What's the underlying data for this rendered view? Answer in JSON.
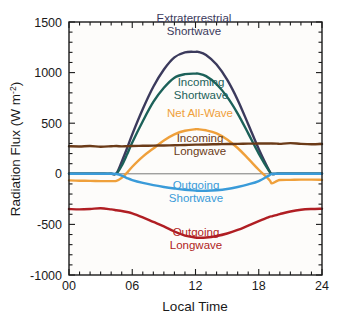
{
  "chart_data": {
    "type": "line",
    "title": "",
    "xlabel": "Local Time",
    "ylabel": "Radiation Flux (W m-2)",
    "ylabel_main": "Radiation Flux (W m",
    "ylabel_sup": "-2",
    "ylabel_close": ")",
    "xlim": [
      0,
      24
    ],
    "ylim": [
      -1000,
      1500
    ],
    "grid": false,
    "legend_position": "inline-annotations",
    "xticks": [
      0,
      6,
      12,
      18,
      24
    ],
    "xticklabels": [
      "00",
      "06",
      "12",
      "18",
      "24"
    ],
    "xminortick_interval": 1,
    "yticks": [
      -1000,
      -500,
      0,
      500,
      1000,
      1500
    ],
    "yticklabels": [
      "-1000",
      "-500",
      "0",
      "500",
      "1000",
      "1500"
    ],
    "yminortick_interval": 100,
    "zero_line": true,
    "x": [
      0,
      1,
      2,
      3,
      4,
      4.5,
      5,
      5.5,
      6,
      7,
      8,
      9,
      10,
      11,
      12,
      12.25,
      13,
      14,
      15,
      16,
      17,
      18,
      19,
      19.25,
      19.75,
      20,
      21,
      22,
      23,
      24
    ],
    "series": [
      {
        "name": "Extraterrestrial Shortwave",
        "color": "#3b3a5c",
        "label_color": "#3b3a5c",
        "values": [
          0,
          0,
          0,
          0,
          0,
          5,
          120,
          250,
          390,
          640,
          860,
          1030,
          1150,
          1200,
          1205,
          1205,
          1175,
          1080,
          930,
          730,
          490,
          245,
          30,
          0,
          0,
          0,
          0,
          0,
          0,
          0
        ]
      },
      {
        "name": "Incoming Shortwave",
        "color": "#1c6159",
        "label_color": "#1c6159",
        "values": [
          0,
          0,
          0,
          0,
          0,
          2,
          80,
          190,
          310,
          520,
          710,
          850,
          950,
          985,
          990,
          990,
          965,
          885,
          760,
          595,
          400,
          200,
          25,
          0,
          0,
          0,
          0,
          0,
          0,
          0
        ]
      },
      {
        "name": "Net All-Wave",
        "color": "#efa03b",
        "label_color": "#efa03b",
        "values": [
          -65,
          -68,
          -70,
          -72,
          -72,
          -70,
          -40,
          10,
          70,
          170,
          250,
          330,
          390,
          425,
          440,
          440,
          430,
          400,
          340,
          255,
          150,
          40,
          -60,
          -95,
          -70,
          -62,
          -60,
          -58,
          -58,
          -60
        ]
      },
      {
        "name": "Incoming Longwave",
        "color": "#6b3b18",
        "label_color": "#6b3b18",
        "values": [
          272,
          270,
          274,
          268,
          272,
          274,
          271,
          273,
          275,
          277,
          278,
          280,
          282,
          285,
          288,
          288,
          290,
          292,
          294,
          296,
          298,
          299,
          300,
          300,
          298,
          296,
          303,
          296,
          292,
          295
        ]
      },
      {
        "name": "Outgoing Shortwave",
        "color": "#3a9bd9",
        "label_color": "#3a9bd9",
        "values": [
          0,
          0,
          0,
          0,
          0,
          -2,
          -18,
          -42,
          -62,
          -90,
          -112,
          -130,
          -145,
          -158,
          -166,
          -168,
          -168,
          -162,
          -150,
          -130,
          -105,
          -72,
          -15,
          -2,
          0,
          0,
          0,
          0,
          0,
          0
        ]
      },
      {
        "name": "Outgoing Longwave",
        "color": "#b01e23",
        "label_color": "#b01e23",
        "values": [
          -348,
          -352,
          -348,
          -340,
          -352,
          -360,
          -368,
          -378,
          -390,
          -430,
          -475,
          -520,
          -570,
          -610,
          -630,
          -632,
          -630,
          -615,
          -590,
          -555,
          -512,
          -468,
          -425,
          -420,
          -405,
          -398,
          -372,
          -355,
          -348,
          -345
        ]
      }
    ],
    "annotations": [
      {
        "id": "ann-extraterrestrial",
        "line1": "Extraterrestrial",
        "line2": "Shortwave",
        "color": "#3b3a5c",
        "x": 194,
        "y": 22
      },
      {
        "id": "ann-incoming-sw",
        "line1": "Incoming",
        "line2": "Shortwave",
        "color": "#1c6159",
        "x": 201,
        "y": 86
      },
      {
        "id": "ann-net-allwave",
        "line1": "Net All-Wave",
        "line2": "",
        "color": "#efa03b",
        "x": 200,
        "y": 117
      },
      {
        "id": "ann-incoming-lw",
        "line1": "Incoming",
        "line2": "Longwave",
        "color": "#6b3b18",
        "x": 200,
        "y": 142
      },
      {
        "id": "ann-outgoing-sw",
        "line1": "Outgoing",
        "line2": "Shortwave",
        "color": "#3a9bd9",
        "x": 196,
        "y": 189
      },
      {
        "id": "ann-outgoing-lw",
        "line1": "Outgoing",
        "line2": "Longwave",
        "color": "#b01e23",
        "x": 196,
        "y": 236
      }
    ]
  }
}
